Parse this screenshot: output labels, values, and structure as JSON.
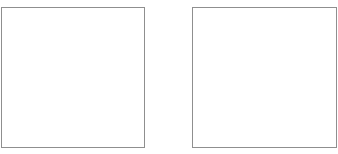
{
  "panels": [
    {
      "id": "left",
      "content": "",
      "border_color": "#8f8f8f"
    },
    {
      "id": "right",
      "content": "",
      "border_color": "#8f8f8f"
    }
  ],
  "background_color": "#ffffff"
}
